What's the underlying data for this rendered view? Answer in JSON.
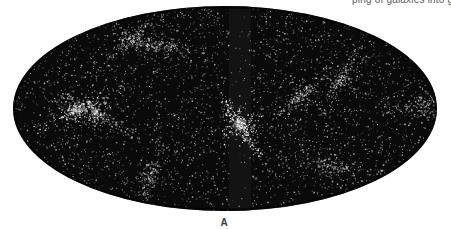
{
  "figure": {
    "caption_fragment": "ping of galaxies into g",
    "panel_label": "A",
    "map": {
      "projection": "elliptical all-sky (Mollweide/Aitoff-style)",
      "ellipse": {
        "cx": 225,
        "cy": 108.5,
        "rx": 212,
        "ry": 102.5
      },
      "colors": {
        "background": "#0a0a0a",
        "galaxy_points": "#ffffff",
        "zone_of_avoidance": "#141414",
        "page": "#ffffff"
      },
      "zone_of_avoidance": {
        "x_center": 240,
        "width": 22
      },
      "features": [
        {
          "name": "central-cluster",
          "x": 240,
          "y": 125,
          "strength": 1.0
        },
        {
          "name": "left-filament",
          "x": 75,
          "y": 110,
          "strength": 0.7
        },
        {
          "name": "left-knot",
          "x": 95,
          "y": 112,
          "strength": 0.6
        },
        {
          "name": "upper-left-knot",
          "x": 130,
          "y": 40,
          "strength": 0.5
        },
        {
          "name": "upper-mid-knot",
          "x": 160,
          "y": 45,
          "strength": 0.45
        },
        {
          "name": "right-arc",
          "x": 300,
          "y": 95,
          "strength": 0.55
        },
        {
          "name": "right-filament",
          "x": 340,
          "y": 80,
          "strength": 0.5
        },
        {
          "name": "far-right-knot",
          "x": 425,
          "y": 105,
          "strength": 0.5
        },
        {
          "name": "lower-right-knot",
          "x": 330,
          "y": 165,
          "strength": 0.45
        },
        {
          "name": "lower-left-knot",
          "x": 150,
          "y": 175,
          "strength": 0.4
        }
      ],
      "point_count": 5200,
      "seed": 20240611
    }
  }
}
